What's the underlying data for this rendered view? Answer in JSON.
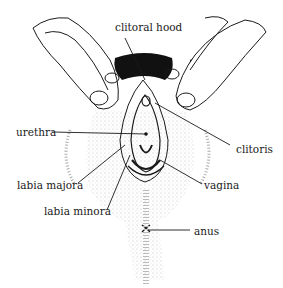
{
  "diagram": {
    "type": "anatomical-illustration",
    "colors": {
      "ink": "#1a1a1a",
      "background": "#ffffff",
      "stipple": "#888888"
    },
    "labels": [
      {
        "id": "clitoral-hood",
        "text": "clitoral hood",
        "x": 115,
        "y": 22,
        "line": [
          [
            125,
            38
          ],
          [
            145,
            80
          ]
        ]
      },
      {
        "id": "urethra",
        "text": "urethra",
        "x": 16,
        "y": 127,
        "line": [
          [
            52,
            132
          ],
          [
            146,
            134
          ]
        ]
      },
      {
        "id": "clitoris",
        "text": "clitoris",
        "x": 236,
        "y": 144,
        "line": [
          [
            230,
            145
          ],
          [
            155,
            103
          ]
        ]
      },
      {
        "id": "labia-majora",
        "text": "labia majora",
        "x": 17,
        "y": 180,
        "line": [
          [
            78,
            183
          ],
          [
            125,
            145
          ]
        ]
      },
      {
        "id": "vagina",
        "text": "vagina",
        "x": 204,
        "y": 180,
        "line": [
          [
            202,
            184
          ],
          [
            160,
            160
          ]
        ]
      },
      {
        "id": "labia-minora",
        "text": "labia minora",
        "x": 44,
        "y": 206,
        "line": [
          [
            107,
            210
          ],
          [
            130,
            155
          ]
        ]
      },
      {
        "id": "anus",
        "text": "anus",
        "x": 194,
        "y": 226,
        "line": [
          [
            190,
            230
          ],
          [
            148,
            230
          ]
        ]
      }
    ]
  }
}
